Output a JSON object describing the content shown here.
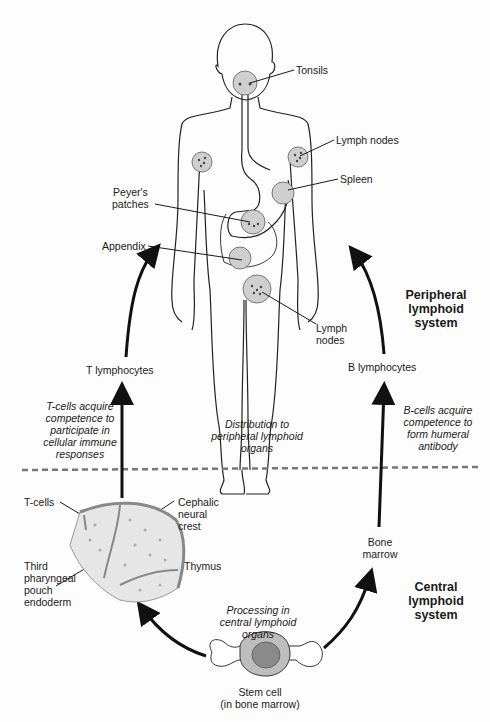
{
  "labels": {
    "tonsils": "Tonsils",
    "lymph_nodes_upper": "Lymph nodes",
    "spleen": "Spleen",
    "peyers_line1": "Peyer's",
    "peyers_line2": "patches",
    "appendix": "Appendix",
    "lymph_lower_line1": "Lymph",
    "lymph_lower_line2": "nodes",
    "t_lymphocytes": "T lymphocytes",
    "b_lymphocytes": "B lymphocytes",
    "t_cells": "T-cells",
    "cephalic_line1": "Cephalic",
    "cephalic_line2": "neural",
    "cephalic_line3": "crest",
    "thymus": "Thymus",
    "third_line1": "Third",
    "third_line2": "pharyngeal",
    "third_line3": "pouch",
    "third_line4": "endoderm",
    "bone_marrow_line1": "Bone",
    "bone_marrow_line2": "marrow",
    "stem_line1": "Stem cell",
    "stem_line2": "(in bone marrow)"
  },
  "annotations": {
    "tcell_line1": "T-cells acquire",
    "tcell_line2": "competence to",
    "tcell_line3": "participate in",
    "tcell_line4": "cellular immune",
    "tcell_line5": "responses",
    "bcell_line1": "B-cells acquire",
    "bcell_line2": "competence to",
    "bcell_line3": "form humeral",
    "bcell_line4": "antibody",
    "dist_line1": "Distribution to",
    "dist_line2": "peripheral lymphoid",
    "dist_line3": "organs",
    "proc_line1": "Processing in",
    "proc_line2": "central lymphoid",
    "proc_line3": "organs"
  },
  "systems": {
    "peripheral_line1": "Peripheral",
    "peripheral_line2": "lymphoid",
    "peripheral_line3": "system",
    "central_line1": "Central",
    "central_line2": "lymphoid",
    "central_line3": "system"
  },
  "colors": {
    "organ_fill": "#cfcfcf",
    "line": "#1a1a1a",
    "divider": "#777777"
  }
}
